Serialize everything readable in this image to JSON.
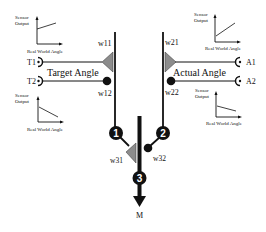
{
  "diagram": {
    "colors": {
      "line": "#111111",
      "weight_excitatory": "#8c8c8c",
      "node": "#111111",
      "node_text": "#ffffff"
    },
    "sensors": {
      "target": {
        "label": "Target Angle",
        "inputs": [
          "T1",
          "T2"
        ]
      },
      "actual": {
        "label": "Actual Angle",
        "inputs": [
          "A1",
          "A2"
        ]
      }
    },
    "weights": {
      "w11": "w11",
      "w12": "w12",
      "w21": "w21",
      "w22": "w22",
      "w31": "w31",
      "w32": "w32"
    },
    "nodes": [
      "1",
      "2",
      "3"
    ],
    "output": "M",
    "graphs": {
      "t1": {
        "ylabel_line1": "Sensor",
        "ylabel_line2": "Output",
        "xlabel": "Real World Angle",
        "trend": "increasing-offset"
      },
      "t2": {
        "ylabel_line1": "Sensor",
        "ylabel_line2": "Output",
        "xlabel": "Real World Angle",
        "trend": "decreasing"
      },
      "a1": {
        "ylabel_line1": "Sensor",
        "ylabel_line2": "Output",
        "xlabel": "Real World Angle",
        "trend": "increasing"
      },
      "a2": {
        "ylabel_line1": "Sensor",
        "ylabel_line2": "Output",
        "xlabel": "Real World Angle",
        "trend": "decreasing-shallow"
      }
    }
  }
}
